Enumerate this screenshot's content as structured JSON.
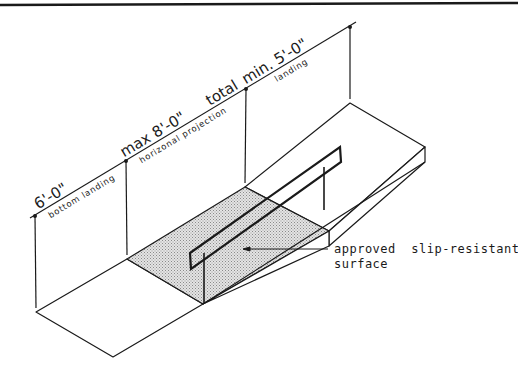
{
  "diagram": {
    "type": "isometric ramp detail",
    "colors": {
      "line": "#1a1a1a",
      "surface_fill": "#c8c8c8",
      "background": "#ffffff"
    },
    "dimensions": [
      {
        "id": "bottom-landing",
        "value": "6'-0\"",
        "label": "bottom landing"
      },
      {
        "id": "ramp-run",
        "value": "max 8'-0\"",
        "label": "horizonal projection",
        "extra": "total"
      },
      {
        "id": "top-landing",
        "value": "min. 5'-0\"",
        "label": "landing"
      }
    ],
    "callout": {
      "line1": "approved  slip-resistant",
      "line2": "surface"
    }
  }
}
